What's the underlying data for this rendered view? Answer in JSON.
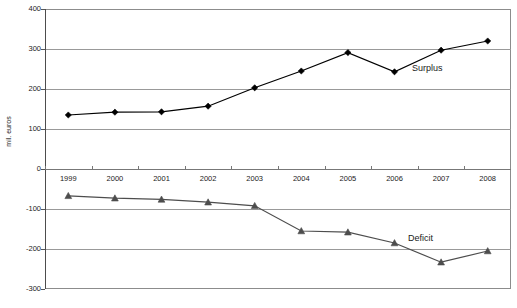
{
  "chart_data": {
    "type": "line",
    "title": "",
    "xlabel": "",
    "ylabel": "mil. euros",
    "categories": [
      "1999",
      "2000",
      "2001",
      "2002",
      "2003",
      "2004",
      "2005",
      "2006",
      "2007",
      "2008"
    ],
    "ylim": [
      -300,
      400
    ],
    "yticks": [
      400,
      300,
      200,
      100,
      0,
      -100,
      -200,
      -300
    ],
    "ytick_labels": [
      "400",
      "300",
      "200",
      "100",
      "0",
      "-100",
      "-200",
      "-300"
    ],
    "grid": true,
    "legend_position": "inline-annotation",
    "series": [
      {
        "name": "Surplus",
        "marker": "diamond",
        "color": "#000000",
        "values": [
          135,
          142,
          143,
          157,
          203,
          245,
          291,
          243,
          297,
          320
        ]
      },
      {
        "name": "Deficit",
        "marker": "triangle",
        "color": "#4d4d4d",
        "values": [
          -67,
          -73,
          -76,
          -83,
          -92,
          -155,
          -158,
          -185,
          -233,
          -205
        ]
      }
    ],
    "annotations": [
      {
        "text": "Surplus",
        "series": "Surplus"
      },
      {
        "text": "Deficit",
        "series": "Deficit"
      }
    ]
  },
  "axis": {
    "y_title": "mil. euros",
    "y_labels": [
      "400",
      "300",
      "200",
      "100",
      "0",
      "-100",
      "-200",
      "-300"
    ],
    "x_labels": [
      "1999",
      "2000",
      "2001",
      "2002",
      "2003",
      "2004",
      "2005",
      "2006",
      "2007",
      "2008"
    ]
  },
  "labels": {
    "surplus": "Surplus",
    "deficit": "Deficit"
  },
  "colors": {
    "surplus_line": "#000000",
    "deficit_line": "#4d4d4d",
    "gridline": "#999999",
    "frame": "#8c8c8c",
    "text": "#1a1a1a",
    "background": "#ffffff"
  }
}
